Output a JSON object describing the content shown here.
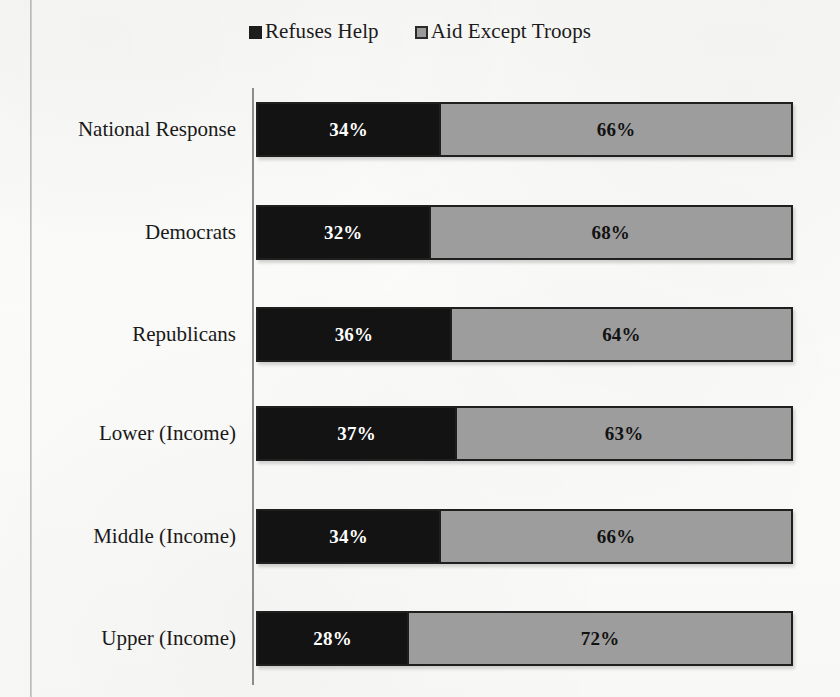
{
  "legend": {
    "entries": [
      {
        "label": "Refuses Help",
        "swatch": "dark-square-icon",
        "color": "#131313"
      },
      {
        "label": "Aid Except Troops",
        "swatch": "gray-square-icon",
        "color": "#9d9d9d"
      }
    ]
  },
  "chart_data": {
    "type": "bar",
    "orientation": "horizontal",
    "stacked": true,
    "normalized_to_percent": true,
    "title": "",
    "xlabel": "",
    "ylabel": "",
    "xlim": [
      0,
      100
    ],
    "grid": false,
    "legend_position": "top-center",
    "axis": {
      "vertical_axis_visible": true,
      "horizontal_axis_visible": false
    },
    "categories": [
      "National Response",
      "Democrats",
      "Republicans",
      "Lower (Income)",
      "Middle (Income)",
      "Upper (Income)"
    ],
    "series": [
      {
        "name": "Refuses Help",
        "color": "#131313",
        "values": [
          34,
          32,
          36,
          37,
          34,
          28
        ]
      },
      {
        "name": "Aid Except Troops",
        "color": "#9d9d9d",
        "values": [
          66,
          68,
          64,
          63,
          66,
          72
        ]
      }
    ],
    "data_labels": [
      {
        "category": "National Response",
        "refuses_help": "34%",
        "aid_except_troops": "66%"
      },
      {
        "category": "Democrats",
        "refuses_help": "32%",
        "aid_except_troops": "68%"
      },
      {
        "category": "Republicans",
        "refuses_help": "36%",
        "aid_except_troops": "64%"
      },
      {
        "category": "Lower (Income)",
        "refuses_help": "37%",
        "aid_except_troops": "63%"
      },
      {
        "category": "Middle (Income)",
        "refuses_help": "34%",
        "aid_except_troops": "66%"
      },
      {
        "category": "Upper (Income)",
        "refuses_help": "28%",
        "aid_except_troops": "72%"
      }
    ]
  }
}
